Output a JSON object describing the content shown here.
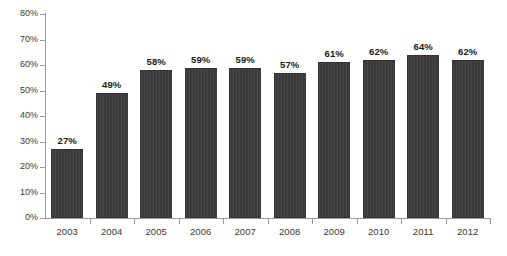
{
  "chart_data": {
    "type": "bar",
    "title": "",
    "subtitle": "",
    "xlabel": "",
    "ylabel": "",
    "categories": [
      "2003",
      "2004",
      "2005",
      "2006",
      "2007",
      "2008",
      "2009",
      "2010",
      "2011",
      "2012"
    ],
    "values": [
      27,
      49,
      58,
      59,
      59,
      57,
      61,
      62,
      64,
      62
    ],
    "value_labels": [
      "27%",
      "49%",
      "58%",
      "59%",
      "59%",
      "57%",
      "61%",
      "62%",
      "64%",
      "62%"
    ],
    "ylim": [
      0,
      80
    ],
    "ytick_values": [
      0,
      10,
      20,
      30,
      40,
      50,
      60,
      70,
      80
    ],
    "ytick_labels": [
      "0%",
      "10%",
      "20%",
      "30%",
      "40%",
      "50%",
      "60%",
      "70%",
      "80%"
    ],
    "grid": false,
    "legend": false,
    "legend_position": "none",
    "annotations": [],
    "colors": {
      "bar_fill": "#3d3d3d",
      "axis_line": "#9a9a9a",
      "value_label_text": "#1a1a1a",
      "tick_label_text": "#3a3a3a",
      "background": "#ffffff"
    }
  }
}
